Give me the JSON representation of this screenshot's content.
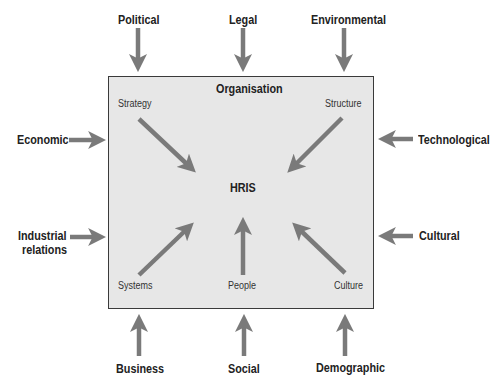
{
  "diagram": {
    "box_title": "Organisation",
    "center_label": "HRIS",
    "internal_factors": [
      {
        "label": "Strategy",
        "position": "top-left"
      },
      {
        "label": "Structure",
        "position": "top-right"
      },
      {
        "label": "Systems",
        "position": "bottom-left"
      },
      {
        "label": "People",
        "position": "bottom-center"
      },
      {
        "label": "Culture",
        "position": "bottom-right"
      }
    ],
    "external_factors": {
      "top": [
        "Political",
        "Legal",
        "Environmental"
      ],
      "left": [
        "Economic",
        "Industrial relations"
      ],
      "left_lines": [
        "Industrial",
        "relations"
      ],
      "right": [
        "Technological",
        "Cultural"
      ],
      "bottom": [
        "Business",
        "Social",
        "Demographic"
      ]
    },
    "colors": {
      "arrow": "#7a7a7a",
      "box_fill": "#e7e7e7",
      "box_border": "#3a3a3a",
      "text": "#222222"
    }
  }
}
